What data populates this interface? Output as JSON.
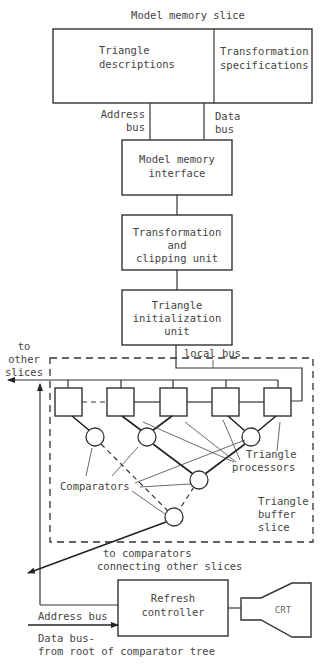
{
  "diagram": {
    "title": "Model memory slice",
    "model_memory": {
      "left_line1": "Triangle",
      "left_line2": "descriptions",
      "right_line1": "Transformation",
      "right_line2": "specifications"
    },
    "buses_top": {
      "address_line1": "Address",
      "address_line2": "bus",
      "data_line1": "Data",
      "data_line2": "bus"
    },
    "blocks": [
      {
        "lines": [
          "Model memory",
          "interface"
        ]
      },
      {
        "lines": [
          "Transformation",
          "and",
          "clipping unit"
        ]
      },
      {
        "lines": [
          "Triangle",
          "initialization",
          "unit"
        ]
      }
    ],
    "local_bus": "local bus",
    "to_other_slices": [
      "to",
      "other",
      "slices"
    ],
    "triangle_processors": [
      "Triangle",
      "processors"
    ],
    "comparators": "Comparators",
    "triangle_buffer_slice": [
      "Triangle",
      "buffer",
      "slice"
    ],
    "to_comparators": [
      "to comparators",
      "connecting other slices"
    ],
    "address_bus": "Address bus",
    "refresh_controller": [
      "Refresh",
      "controller"
    ],
    "crt": "CRT",
    "data_bus": [
      "Data bus-",
      "from root of comparator tree"
    ],
    "processor_count": 5,
    "comparator_count": 5
  }
}
